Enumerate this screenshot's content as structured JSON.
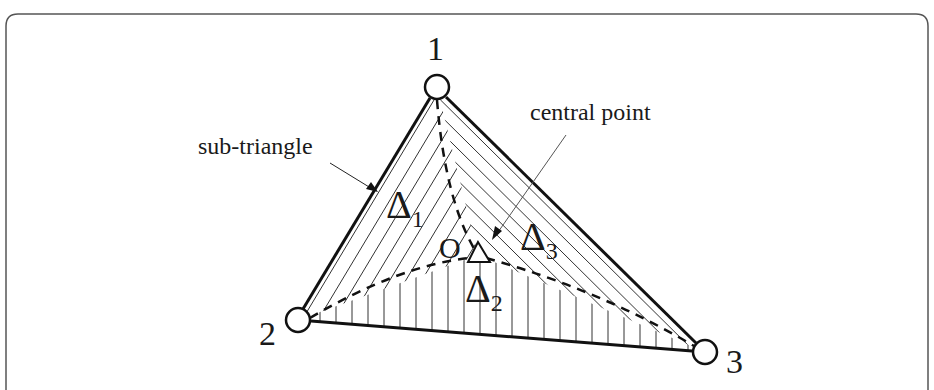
{
  "figure": {
    "type": "triangle-subdivision-diagram",
    "frame": {
      "stroke": "#555555",
      "open_bottom": true
    },
    "vertices": [
      {
        "id": "1",
        "label": "1",
        "x": 437,
        "y": 87
      },
      {
        "id": "2",
        "label": "2",
        "x": 298,
        "y": 320
      },
      {
        "id": "3",
        "label": "3",
        "x": 705,
        "y": 352
      }
    ],
    "central_point": {
      "label": "O",
      "x": 478,
      "y": 255
    },
    "sub_triangles": [
      {
        "symbol": "Δ",
        "index": "1",
        "hatch": "diagonal-right"
      },
      {
        "symbol": "Δ",
        "index": "2",
        "hatch": "vertical"
      },
      {
        "symbol": "Δ",
        "index": "3",
        "hatch": "diagonal-left"
      }
    ],
    "annotations": {
      "sub_triangle": "sub-triangle",
      "central_point": "central point"
    },
    "colors": {
      "line": "#111111",
      "hatch": "#333333",
      "text": "#1a1a1a",
      "background": "#ffffff"
    }
  }
}
